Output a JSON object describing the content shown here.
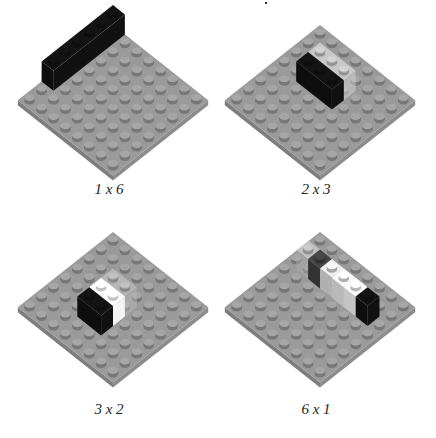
{
  "figure": {
    "panels": [
      {
        "label": "1 x 6",
        "board": "8x8 baseplate",
        "bricks": [
          {
            "color": "#111111",
            "size": "1x6",
            "orientation": "along-left-edge"
          }
        ]
      },
      {
        "label": "2 x 3",
        "board": "8x8 baseplate",
        "bricks": [
          {
            "color": "#111111",
            "size": "1x3"
          },
          {
            "color": "#cfcfcf",
            "size": "1x3",
            "faded": true
          }
        ]
      },
      {
        "label": "3 x 2",
        "board": "8x8 baseplate",
        "bricks": [
          {
            "color": "#111111",
            "size": "1x2"
          },
          {
            "color": "#f4f4f4",
            "size": "1x2"
          },
          {
            "color": "#bdbdbd",
            "size": "1x2",
            "faded": true
          }
        ]
      },
      {
        "label": "6 x 1",
        "board": "8x8 baseplate",
        "bricks": [
          {
            "color": "#111111",
            "size": "1x1"
          },
          {
            "color": "#e6e6e6",
            "size": "1x1"
          },
          {
            "color": "#dadada",
            "size": "1x1"
          },
          {
            "color": "#cfcfcf",
            "size": "1x1"
          },
          {
            "color": "#3c3c3c",
            "size": "1x1"
          },
          {
            "color": "#c8c8c8",
            "size": "1x1",
            "faded": true
          }
        ]
      }
    ]
  },
  "colors": {
    "plate_top": "#9a9a9a",
    "plate_side_left": "#7e7e7e",
    "plate_side_right": "#8c8c8c",
    "stud": "#a6a6a6",
    "stud_shadow": "#777777",
    "background": "#ffffff"
  }
}
